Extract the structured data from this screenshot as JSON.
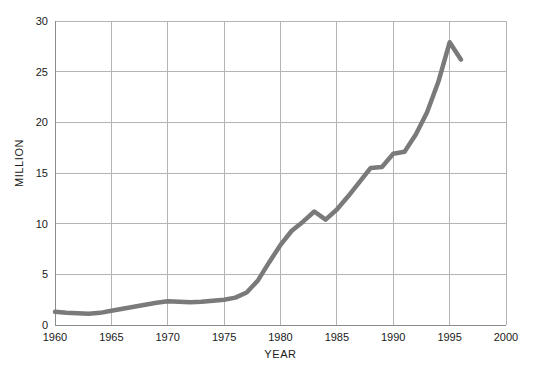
{
  "chart_data": {
    "type": "line",
    "title": "",
    "xlabel": "YEAR",
    "ylabel": "MILLION",
    "xlim": [
      1960,
      2000
    ],
    "ylim": [
      0,
      30
    ],
    "grid": true,
    "legend": null,
    "line_color": "#7a7a7a",
    "grid_color": "#b4b4b4",
    "axis_color": "#8c8c8c",
    "background": "#ffffff",
    "xticks": [
      1960,
      1965,
      1970,
      1975,
      1980,
      1985,
      1990,
      1995,
      2000
    ],
    "xtick_labels": [
      "1960",
      "1965",
      "1970",
      "1975",
      "1980",
      "1985",
      "1990",
      "1995",
      "2000"
    ],
    "yticks": [
      0,
      5,
      10,
      15,
      20,
      25,
      30
    ],
    "ytick_labels": [
      "0",
      "5",
      "10",
      "15",
      "20",
      "25",
      "30"
    ],
    "x": [
      1960,
      1961,
      1962,
      1963,
      1964,
      1965,
      1966,
      1967,
      1968,
      1969,
      1970,
      1971,
      1972,
      1973,
      1974,
      1975,
      1976,
      1977,
      1978,
      1979,
      1980,
      1981,
      1982,
      1983,
      1984,
      1985,
      1986,
      1987,
      1988,
      1989,
      1990,
      1991,
      1992,
      1993,
      1994,
      1995,
      1996
    ],
    "values": [
      1.3,
      1.2,
      1.15,
      1.1,
      1.2,
      1.4,
      1.6,
      1.8,
      2.0,
      2.2,
      2.35,
      2.3,
      2.25,
      2.3,
      2.4,
      2.5,
      2.7,
      3.2,
      4.4,
      6.2,
      7.9,
      9.3,
      10.2,
      11.2,
      10.4,
      11.4,
      12.7,
      14.1,
      15.5,
      15.6,
      16.9,
      17.1,
      18.8,
      21.0,
      24.0,
      27.9,
      26.2
    ],
    "series_name": "",
    "annotations": []
  },
  "axis": {
    "y_title": "MILLION",
    "x_title": "YEAR"
  }
}
